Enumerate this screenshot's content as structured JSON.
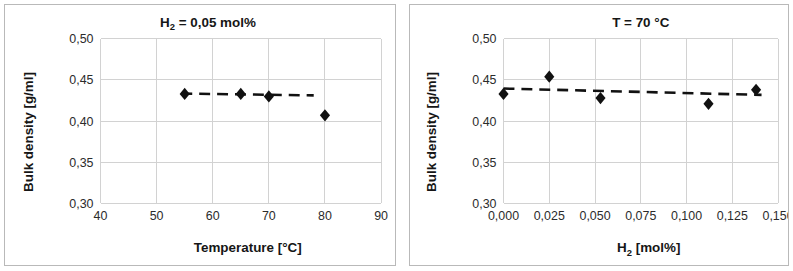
{
  "figure": {
    "background": "#ffffff",
    "border_color": "#b9b9b9",
    "marker_color": "#111111",
    "grid_color": "#d2d2d2",
    "panel_count": 2
  },
  "chart_data": [
    {
      "type": "scatter",
      "panel": "left",
      "title": "H2 = 0,05 mol%",
      "title_main": "H",
      "title_sub": "2",
      "title_rest": " = 0,05 mol%",
      "xlabel": "Temperature [°C]",
      "ylabel": "Bulk density [g/ml]",
      "xlim": [
        40,
        90
      ],
      "ylim": [
        0.3,
        0.5
      ],
      "xticks": [
        40,
        50,
        60,
        70,
        80,
        90
      ],
      "xtick_labels": [
        "40",
        "50",
        "60",
        "70",
        "80",
        "90"
      ],
      "yticks": [
        0.3,
        0.35,
        0.4,
        0.45,
        0.5
      ],
      "ytick_labels": [
        "0,30",
        "0,35",
        "0,40",
        "0,45",
        "0,50"
      ],
      "grid": true,
      "legend": "none",
      "x": [
        55,
        65,
        70,
        80
      ],
      "y": [
        0.433,
        0.433,
        0.43,
        0.407
      ],
      "points": [
        {
          "x": 55,
          "y": 0.433
        },
        {
          "x": 65,
          "y": 0.433
        },
        {
          "x": 70,
          "y": 0.43
        },
        {
          "x": 80,
          "y": 0.407
        }
      ],
      "trendline": {
        "style": "dashed",
        "x_start": 54.4,
        "y_start": 0.4335,
        "x_end": 78.0,
        "y_end": 0.4312
      }
    },
    {
      "type": "scatter",
      "panel": "right",
      "title": "T = 70 °C",
      "xlabel": "H2 [mol%]",
      "xlabel_main": "H",
      "xlabel_sub": "2",
      "xlabel_rest": " [mol%]",
      "ylabel": "Bulk density [g/ml]",
      "xlim": [
        0.0,
        0.15
      ],
      "ylim": [
        0.3,
        0.5
      ],
      "xticks": [
        0.0,
        0.025,
        0.05,
        0.075,
        0.1,
        0.125,
        0.15
      ],
      "xtick_labels": [
        "0,000",
        "0,025",
        "0,050",
        "0,075",
        "0,100",
        "0,125",
        "0,150"
      ],
      "yticks": [
        0.3,
        0.35,
        0.4,
        0.45,
        0.5
      ],
      "ytick_labels": [
        "0,30",
        "0,35",
        "0,40",
        "0,45",
        "0,50"
      ],
      "grid": true,
      "legend": "none",
      "x": [
        0.0,
        0.025,
        0.053,
        0.112,
        0.138
      ],
      "y": [
        0.433,
        0.454,
        0.428,
        0.421,
        0.438
      ],
      "points": [
        {
          "x": 0.0,
          "y": 0.433
        },
        {
          "x": 0.025,
          "y": 0.454
        },
        {
          "x": 0.053,
          "y": 0.428
        },
        {
          "x": 0.112,
          "y": 0.421
        },
        {
          "x": 0.138,
          "y": 0.438
        }
      ],
      "trendline": {
        "style": "dashed",
        "x_start": 0.0,
        "y_start": 0.4395,
        "x_end": 0.141,
        "y_end": 0.4318
      }
    }
  ]
}
